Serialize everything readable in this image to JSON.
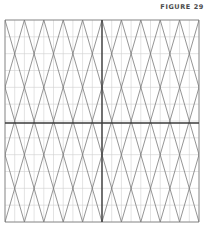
{
  "figure": {
    "label": "FIGURE 29"
  },
  "grid": {
    "left": 5,
    "right": 199,
    "top": 20,
    "bottom": 222,
    "columns": 10,
    "rows": 6,
    "axis_x": 102,
    "axis_y": 123,
    "colors": {
      "grid_line": "#d0d0d0",
      "diagonal": "#7a7a7a",
      "axis": "#3a3a3a"
    }
  }
}
